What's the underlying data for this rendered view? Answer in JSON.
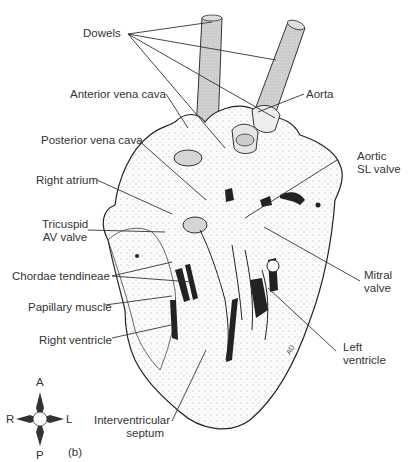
{
  "figure": {
    "panel_label": "(b)",
    "labels": {
      "dowels": "Dowels",
      "anterior_vena_cava": "Anterior vena cava",
      "aorta": "Aorta",
      "posterior_vena_cava": "Posterior vena cava",
      "aortic_sl_valve_1": "Aortic",
      "aortic_sl_valve_2": "SL valve",
      "right_atrium": "Right atrium",
      "tricuspid_1": "Tricuspid",
      "tricuspid_2": "AV valve",
      "mitral_1": "Mitral",
      "mitral_2": "valve",
      "chordae_tendineae": "Chordae tendineae",
      "papillary_muscle": "Papillary muscle",
      "right_ventricle": "Right ventricle",
      "left_ventricle_1": "Left",
      "left_ventricle_2": "ventricle",
      "interventricular_1": "Interventricular",
      "interventricular_2": "septum"
    },
    "compass": {
      "north": "A",
      "south": "P",
      "west": "R",
      "east": "L"
    },
    "signature": "AD"
  }
}
